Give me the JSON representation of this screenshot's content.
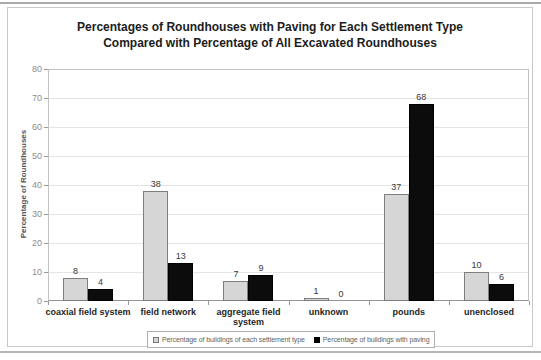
{
  "chart_data": {
    "type": "bar",
    "title": "Percentages of Roundhouses with Paving for Each Settlement Type Compared with Percentage of All Excavated Roundhouses",
    "title_lines": [
      "Percentages of Roundhouses with Paving for Each Settlement Type",
      "Compared with Percentage of All Excavated Roundhouses"
    ],
    "ylabel": "Percentage of Roundhouses",
    "xlabel": "",
    "ylim": [
      0,
      80
    ],
    "ytick_step": 10,
    "grid": true,
    "legend_position": "bottom",
    "value_labels_shown": true,
    "categories": [
      "coaxial field system",
      "field network",
      "aggregate field system",
      "unknown",
      "pounds",
      "unenclosed"
    ],
    "category_label_lines": [
      [
        "coaxial field system"
      ],
      [
        "field network"
      ],
      [
        "aggregate field",
        "system"
      ],
      [
        "unknown"
      ],
      [
        "pounds"
      ],
      [
        "unenclosed"
      ]
    ],
    "series": [
      {
        "name": "Percentage of buildings of each settlement type",
        "color": "#d6d6d6",
        "border_color": "#7e7e7e",
        "values": [
          8,
          38,
          7,
          1,
          37,
          10
        ]
      },
      {
        "name": "Percentage of buildings with paving",
        "color": "#0c0c0c",
        "border_color": "#000000",
        "values": [
          4,
          13,
          9,
          0,
          68,
          6
        ]
      }
    ]
  }
}
